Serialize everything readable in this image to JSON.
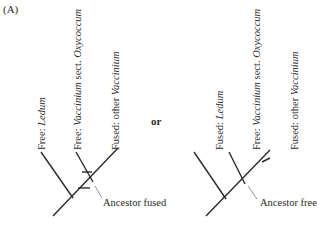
{
  "panel_label": "(A)",
  "connector": "or",
  "trees": [
    {
      "leaves": [
        {
          "prefix": "Free: ",
          "taxon": "Ledum",
          "suffix": ""
        },
        {
          "prefix": "Free: ",
          "taxon": "Vaccinium",
          "suffix": " sect. ",
          "taxon2": "Oxycoccum"
        },
        {
          "prefix": "Fused: other ",
          "taxon": "Vaccinium",
          "suffix": ""
        }
      ],
      "annotation": "Ancestor fused"
    },
    {
      "leaves": [
        {
          "prefix": "Fused: ",
          "taxon": "Ledum",
          "suffix": ""
        },
        {
          "prefix": "Free: ",
          "taxon": "Vaccinium",
          "suffix": " sect. ",
          "taxon2": "Oxycoccum"
        },
        {
          "prefix": "Fused: other ",
          "taxon": "Vaccinium",
          "suffix": ""
        }
      ],
      "annotation": "Ancestor free"
    }
  ],
  "colors": {
    "line": "#2a2a2a",
    "leader": "#7a7a7a"
  }
}
